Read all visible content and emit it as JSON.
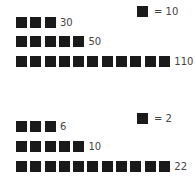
{
  "chart_data": [
    {
      "type": "pictograph",
      "legend": {
        "symbol": "square",
        "unit_value": 10,
        "label": "= 10"
      },
      "categories": [
        "row1",
        "row2",
        "row3"
      ],
      "values": [
        30,
        50,
        110
      ],
      "symbols_per_row": [
        3,
        5,
        11
      ],
      "labels": [
        "30",
        "50",
        "110"
      ]
    },
    {
      "type": "pictograph",
      "legend": {
        "symbol": "square",
        "unit_value": 2,
        "label": "= 2"
      },
      "categories": [
        "row1",
        "row2",
        "row3"
      ],
      "values": [
        6,
        10,
        22
      ],
      "symbols_per_row": [
        3,
        5,
        11
      ],
      "labels": [
        "6",
        "10",
        "22"
      ]
    }
  ],
  "colors": {
    "symbol": "#1a1a1a",
    "text": "#444444"
  }
}
